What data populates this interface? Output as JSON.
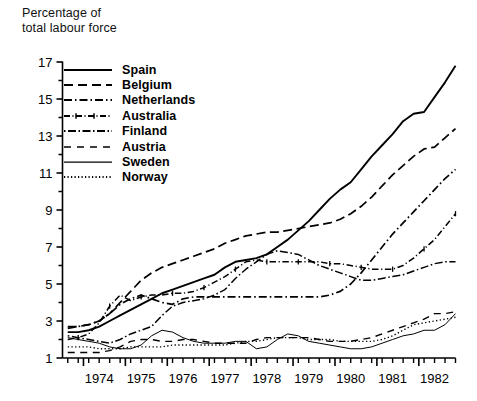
{
  "chart_data": {
    "type": "line",
    "title": "Percentage of\ntotal labour force",
    "ylabel": "Percentage of total labour force",
    "xlabel": "",
    "ylim": [
      1,
      17
    ],
    "xlim": [
      1973.5,
      1982.875
    ],
    "grid": false,
    "legend_position": "upper-left-inside",
    "ytick_labels": [
      "1",
      "3",
      "5",
      "7",
      "9",
      "11",
      "13",
      "15",
      "17"
    ],
    "ytick_values": [
      1,
      3,
      5,
      7,
      9,
      11,
      13,
      15,
      17
    ],
    "yminor_values": [
      2,
      4,
      6,
      8,
      10,
      12,
      14,
      16
    ],
    "xtick_labels": [
      "1974",
      "1975",
      "1976",
      "1977",
      "1978",
      "1979",
      "1980",
      "1981",
      "1982"
    ],
    "xtick_values": [
      1974,
      1975,
      1976,
      1977,
      1978,
      1979,
      1980,
      1981,
      1982
    ],
    "x_minor_interval": 0.25,
    "x": [
      1973.625,
      1973.875,
      1974.125,
      1974.375,
      1974.625,
      1974.875,
      1975.125,
      1975.375,
      1975.625,
      1975.875,
      1976.125,
      1976.375,
      1976.625,
      1976.875,
      1977.125,
      1977.375,
      1977.625,
      1977.875,
      1978.125,
      1978.375,
      1978.625,
      1978.875,
      1979.125,
      1979.375,
      1979.625,
      1979.875,
      1980.125,
      1980.375,
      1980.625,
      1980.875,
      1981.125,
      1981.375,
      1981.625,
      1981.875,
      1982.125,
      1982.375,
      1982.625,
      1982.875
    ],
    "series": [
      {
        "name": "Spain",
        "style": "solid",
        "width": 1.9,
        "marker": "none",
        "values": [
          2.4,
          2.4,
          2.5,
          2.7,
          3.0,
          3.3,
          3.6,
          3.9,
          4.2,
          4.5,
          4.7,
          4.9,
          5.1,
          5.3,
          5.5,
          5.9,
          6.2,
          6.3,
          6.4,
          6.6,
          7.0,
          7.4,
          7.9,
          8.4,
          9.0,
          9.6,
          10.1,
          10.5,
          11.2,
          11.9,
          12.5,
          13.1,
          13.8,
          14.2,
          14.3,
          15.1,
          15.9,
          16.8
        ]
      },
      {
        "name": "Belgium",
        "style": "dashed",
        "width": 1.7,
        "marker": "none",
        "values": [
          2.7,
          2.7,
          2.8,
          3.0,
          3.4,
          4.0,
          4.6,
          5.2,
          5.6,
          5.9,
          6.1,
          6.3,
          6.5,
          6.7,
          6.9,
          7.2,
          7.4,
          7.6,
          7.7,
          7.8,
          7.8,
          7.9,
          8.0,
          8.1,
          8.2,
          8.3,
          8.5,
          8.8,
          9.2,
          9.7,
          10.3,
          10.9,
          11.4,
          11.9,
          12.3,
          12.4,
          12.9,
          13.4
        ]
      },
      {
        "name": "Netherlands",
        "style": "dashdot",
        "width": 1.7,
        "marker": "none",
        "values": [
          2.6,
          2.7,
          2.8,
          3.0,
          3.4,
          3.9,
          4.2,
          4.4,
          4.2,
          4.0,
          3.9,
          4.2,
          4.3,
          4.3,
          4.3,
          4.3,
          4.3,
          4.3,
          4.3,
          4.3,
          4.3,
          4.3,
          4.3,
          4.3,
          4.3,
          4.4,
          4.6,
          5.0,
          5.6,
          6.3,
          7.0,
          7.7,
          8.3,
          8.9,
          9.5,
          10.1,
          10.7,
          11.2
        ]
      },
      {
        "name": "Australia",
        "style": "dashdot-marker",
        "width": 1.5,
        "marker": "plus",
        "values": [
          2.0,
          2.1,
          2.3,
          2.9,
          3.8,
          4.4,
          4.1,
          4.3,
          4.4,
          4.4,
          4.5,
          4.5,
          4.6,
          4.8,
          5.1,
          5.4,
          5.8,
          6.2,
          6.3,
          6.2,
          6.2,
          6.2,
          6.2,
          6.2,
          6.2,
          6.1,
          6.1,
          6.0,
          5.9,
          5.8,
          5.8,
          5.8,
          6.0,
          6.4,
          6.9,
          7.4,
          8.1,
          8.8
        ]
      },
      {
        "name": "Finland",
        "style": "dashdotdot",
        "width": 1.5,
        "marker": "none",
        "values": [
          2.2,
          2.1,
          2.0,
          1.9,
          1.8,
          2.0,
          2.3,
          2.5,
          2.7,
          3.3,
          3.8,
          4.0,
          4.1,
          4.2,
          4.4,
          4.7,
          5.3,
          5.8,
          6.2,
          6.6,
          6.8,
          6.7,
          6.6,
          6.3,
          6.0,
          5.8,
          5.6,
          5.4,
          5.2,
          5.2,
          5.3,
          5.4,
          5.5,
          5.7,
          5.9,
          6.1,
          6.2,
          6.2
        ]
      },
      {
        "name": "Austria",
        "style": "longdash",
        "width": 1.4,
        "marker": "none",
        "values": [
          1.3,
          1.3,
          1.3,
          1.3,
          1.4,
          1.6,
          1.9,
          2.0,
          2.0,
          1.9,
          1.9,
          2.0,
          2.0,
          1.9,
          1.8,
          1.8,
          1.8,
          1.8,
          2.0,
          2.1,
          2.1,
          2.1,
          2.1,
          2.1,
          2.0,
          1.9,
          1.9,
          1.9,
          2.0,
          2.1,
          2.3,
          2.5,
          2.7,
          2.9,
          3.1,
          3.4,
          3.4,
          3.5
        ]
      },
      {
        "name": "Sweden",
        "style": "solid-thin",
        "width": 1.0,
        "marker": "none",
        "values": [
          2.1,
          2.0,
          1.9,
          1.8,
          1.6,
          1.5,
          1.5,
          1.7,
          2.2,
          2.5,
          2.4,
          2.1,
          1.9,
          1.8,
          1.8,
          1.8,
          1.9,
          1.9,
          1.5,
          1.6,
          2.0,
          2.3,
          2.2,
          1.9,
          1.8,
          1.7,
          1.6,
          1.5,
          1.5,
          1.6,
          1.8,
          2.0,
          2.2,
          2.3,
          2.5,
          2.5,
          2.8,
          3.4
        ]
      },
      {
        "name": "Norway",
        "style": "dotted",
        "width": 1.4,
        "marker": "none",
        "values": [
          1.6,
          1.6,
          1.6,
          1.5,
          1.5,
          1.5,
          1.6,
          1.6,
          1.6,
          1.6,
          1.7,
          1.7,
          1.7,
          1.7,
          1.7,
          1.7,
          1.8,
          1.9,
          1.9,
          2.0,
          2.1,
          2.1,
          2.1,
          2.0,
          2.0,
          2.0,
          1.9,
          1.9,
          1.9,
          1.9,
          2.0,
          2.2,
          2.5,
          2.8,
          2.9,
          3.0,
          3.1,
          3.2
        ]
      }
    ]
  },
  "legend": {
    "items": [
      {
        "label": "Spain"
      },
      {
        "label": "Belgium"
      },
      {
        "label": "Netherlands"
      },
      {
        "label": "Australia"
      },
      {
        "label": "Finland"
      },
      {
        "label": "Austria"
      },
      {
        "label": "Sweden"
      },
      {
        "label": "Norway"
      }
    ]
  },
  "colors": {
    "line": "#000000",
    "axis": "#000000",
    "background": "#ffffff"
  }
}
